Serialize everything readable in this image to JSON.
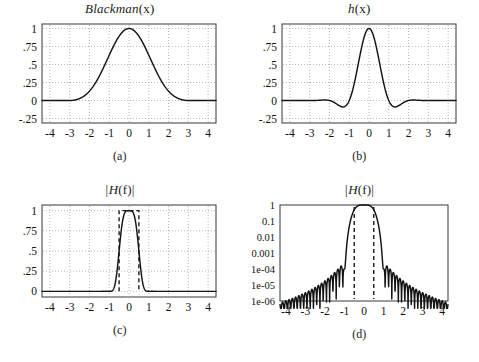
{
  "figure": {
    "panels": [
      {
        "id": "a",
        "caption": "(a)",
        "title_main": "Blackman",
        "title_arg": "(x)"
      },
      {
        "id": "b",
        "caption": "(b)",
        "title_main": "h",
        "title_arg": "(x)"
      },
      {
        "id": "c",
        "caption": "(c)",
        "title_main": "|H",
        "title_arg": "(f)|"
      },
      {
        "id": "d",
        "caption": "(d)",
        "title_main": "|H",
        "title_arg": "(f)|"
      }
    ]
  },
  "chart_data": [
    {
      "id": "a",
      "type": "line",
      "title": "Blackman(x)",
      "xlabel": "x",
      "ylabel": "",
      "xlim": [
        -4.4,
        4.4
      ],
      "ylim": [
        -0.3125,
        1.0625
      ],
      "xticks": [
        -4,
        -3,
        -2,
        -1,
        0,
        1,
        2,
        3,
        4
      ],
      "xticklabels": [
        "-4",
        "-3",
        "-2",
        "-1",
        "0",
        "1",
        "2",
        "3",
        "4"
      ],
      "yticks": [
        1,
        0.75,
        0.5,
        0.25,
        0,
        -0.25
      ],
      "yticklabels": [
        "1",
        ".75",
        ".5",
        ".25",
        "0",
        "-.25"
      ],
      "grid": true,
      "function": "blackman",
      "half_width": 3,
      "peak": 1,
      "description": "Blackman window, unity at x=0, tapering smoothly to 0 at |x|=3"
    },
    {
      "id": "b",
      "type": "line",
      "title": "h(x)",
      "xlabel": "x",
      "ylabel": "",
      "xlim": [
        -4.4,
        4.4
      ],
      "ylim": [
        -0.3125,
        1.0625
      ],
      "xticks": [
        -4,
        -3,
        -2,
        -1,
        0,
        1,
        2,
        3,
        4
      ],
      "xticklabels": [
        "-4",
        "-3",
        "-2",
        "-1",
        "0",
        "1",
        "2",
        "3",
        "4"
      ],
      "yticks": [
        1,
        0.75,
        0.5,
        0.25,
        0,
        -0.25
      ],
      "yticklabels": [
        "1",
        ".75",
        ".5",
        ".25",
        "0",
        "-.25"
      ],
      "grid": true,
      "function": "blackman_windowed_sinc",
      "half_width": 3,
      "peak": 1,
      "sidelobe_min": -0.12,
      "sidelobe_min_x": 1.35,
      "description": "Blackman-windowed sinc: main lobe peak 1 at x=0, negative lobes near x=+/-1.35"
    },
    {
      "id": "c",
      "type": "line",
      "title": "|H(f)|",
      "xlabel": "f",
      "ylabel": "",
      "xlim": [
        -4.4,
        4.4
      ],
      "ylim": [
        -0.07,
        1.07
      ],
      "xticks": [
        -4,
        -3,
        -2,
        -1,
        0,
        1,
        2,
        3,
        4
      ],
      "xticklabels": [
        "-4",
        "-3",
        "-2",
        "-1",
        "0",
        "1",
        "2",
        "3",
        "4"
      ],
      "yticks": [
        1,
        0.75,
        0.5,
        0.25,
        0
      ],
      "yticklabels": [
        "1",
        ".75",
        ".5",
        ".25",
        "0"
      ],
      "grid": true,
      "scale": "linear",
      "ideal_filter": {
        "cutoff": 0.5,
        "height": 1,
        "style": "dashed"
      },
      "description": "Magnitude response on linear scale with dashed ideal brick-wall filter from -0.5 to 0.5"
    },
    {
      "id": "d",
      "type": "line",
      "title": "|H(f)|",
      "xlabel": "f",
      "ylabel": "",
      "xlim": [
        -4.3,
        4.3
      ],
      "ylim": [
        1e-06,
        1
      ],
      "xticks": [
        -4,
        -3,
        -2,
        -1,
        0,
        1,
        2,
        3,
        4
      ],
      "xticklabels": [
        "-4",
        "-3",
        "-2",
        "-1",
        "0",
        "1",
        "2",
        "3",
        "4"
      ],
      "yticks": [
        1,
        0.1,
        0.01,
        0.001,
        0.0001,
        1e-05,
        1e-06
      ],
      "yticklabels": [
        "1",
        "0.1",
        "0.01",
        "0.001",
        "1e-04",
        "1e-05",
        "1e-06"
      ],
      "grid": false,
      "scale": "log",
      "ideal_filter": {
        "cutoff": 0.5,
        "style": "dashed-verticals"
      },
      "description": "Same magnitude response on logarithmic scale showing sidelobes decaying from 1e-04 to below 1e-06"
    }
  ]
}
